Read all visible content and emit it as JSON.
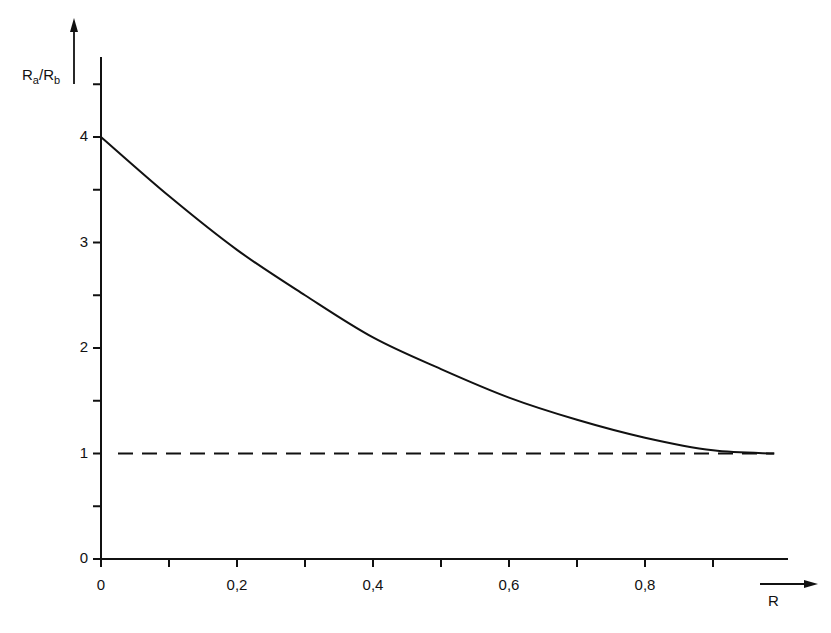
{
  "chart_data": {
    "type": "line",
    "title": "",
    "xlabel": "R",
    "ylabel": "Ra/Rb",
    "ylabel_parts": {
      "base1": "R",
      "sub1": "a",
      "sep": "/",
      "base2": "R",
      "sub2": "b"
    },
    "xlim": [
      0,
      1.0
    ],
    "ylim": [
      0,
      4.7
    ],
    "x_tick_labels": [
      "0",
      "0,2",
      "0,4",
      "0,6",
      "0,8"
    ],
    "x_ticks": [
      0,
      0.1,
      0.2,
      0.3,
      0.4,
      0.5,
      0.6,
      0.7,
      0.8,
      0.9
    ],
    "y_tick_labels": [
      "0",
      "1",
      "2",
      "3",
      "4"
    ],
    "y_ticks": [
      0,
      0.5,
      1,
      1.5,
      2,
      2.5,
      3,
      3.5,
      4,
      4.5
    ],
    "grid": false,
    "legend": null,
    "series": [
      {
        "name": "Ra/Rb",
        "style": "solid",
        "x": [
          0,
          0.1,
          0.2,
          0.3,
          0.4,
          0.5,
          0.6,
          0.7,
          0.8,
          0.9,
          0.99
        ],
        "values": [
          4.0,
          3.44,
          2.93,
          2.5,
          2.1,
          1.8,
          1.53,
          1.32,
          1.15,
          1.03,
          1.0
        ]
      },
      {
        "name": "reference line",
        "style": "dashed",
        "x": [
          0,
          0.99
        ],
        "values": [
          1.0,
          1.0
        ]
      }
    ]
  }
}
